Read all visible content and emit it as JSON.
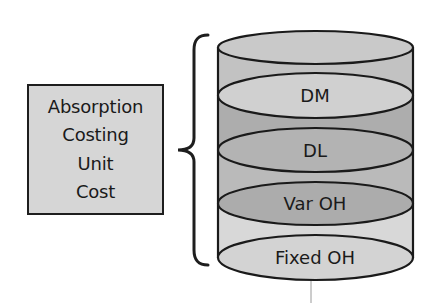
{
  "diagram": {
    "label_box": {
      "lines": [
        "Absorption",
        "Costing",
        "Unit",
        "Cost"
      ],
      "fill": "#d6d6d6",
      "border": "#1e1e1e"
    },
    "brace": {
      "icon": "curly-brace-left",
      "stroke": "#1e1e1e"
    },
    "cylinder": {
      "stroke": "#1a1a1a",
      "layers": [
        {
          "label": "",
          "ellipse_fill": "#c9c9c9",
          "band_fill": "#c2c2c2"
        },
        {
          "label": "DM",
          "ellipse_fill": "#d0d0d0",
          "band_fill": "#adadad"
        },
        {
          "label": "DL",
          "ellipse_fill": "#b3b3b3",
          "band_fill": "#bababa"
        },
        {
          "label": "Var OH",
          "ellipse_fill": "#acacac",
          "band_fill": "#d8d8d8"
        },
        {
          "label": "Fixed OH",
          "ellipse_fill": "#d3d3d3",
          "band_fill": ""
        }
      ]
    }
  }
}
